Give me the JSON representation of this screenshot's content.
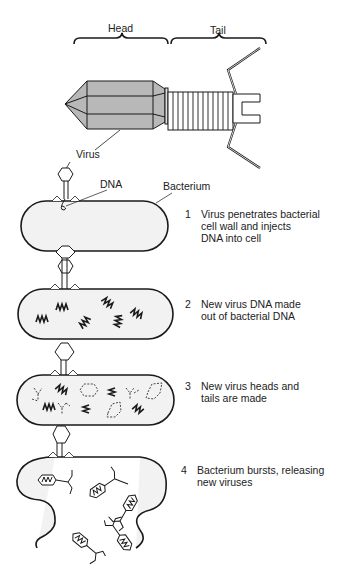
{
  "labels": {
    "head": "Head",
    "tail": "Tail",
    "virus": "Virus",
    "dna": "DNA",
    "bacterium": "Bacterium"
  },
  "steps": [
    {
      "number": "1",
      "text": "Virus penetrates bacterial\ncell wall and injects\nDNA into cell"
    },
    {
      "number": "2",
      "text": "New virus DNA made\nout of bacterial DNA"
    },
    {
      "number": "3",
      "text": "New virus heads and\ntails are made"
    },
    {
      "number": "4",
      "text": "Bacterium bursts, releasing\nnew viruses"
    }
  ],
  "colors": {
    "head_fill": "#b8b8b8",
    "cell_fill": "#f2f2f2",
    "line": "#1a1a1a"
  }
}
